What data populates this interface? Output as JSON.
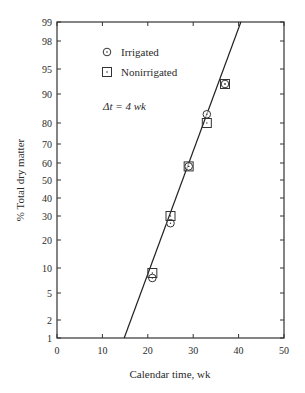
{
  "chart_data": {
    "type": "scatter",
    "title": "",
    "xlabel": "Calendar time, wk",
    "ylabel": "% Total dry matter",
    "xlim": [
      0,
      50
    ],
    "ylim": [
      1,
      99
    ],
    "yscale": "probability",
    "x_ticks": [
      0,
      10,
      20,
      30,
      40,
      50
    ],
    "y_ticks": [
      1,
      2,
      5,
      10,
      20,
      30,
      40,
      50,
      60,
      70,
      80,
      90,
      95,
      98,
      99
    ],
    "grid": false,
    "legend_position": "upper-left",
    "annotation": "Δt = 4 wk",
    "series": [
      {
        "name": "Irrigated",
        "marker": "circle",
        "points": [
          {
            "x": 21,
            "y": 8
          },
          {
            "x": 25,
            "y": 27
          },
          {
            "x": 29,
            "y": 58
          },
          {
            "x": 33,
            "y": 83
          },
          {
            "x": 37,
            "y": 92
          }
        ]
      },
      {
        "name": "Nonirrigated",
        "marker": "square",
        "points": [
          {
            "x": 21,
            "y": 9
          },
          {
            "x": 25,
            "y": 30
          },
          {
            "x": 29,
            "y": 58
          },
          {
            "x": 33,
            "y": 80
          },
          {
            "x": 37,
            "y": 92
          }
        ]
      }
    ],
    "fit_line": {
      "x_start": 14.8,
      "y_start": 1,
      "x_end": 40.5,
      "y_end": 99
    }
  },
  "labels": {
    "xlabel": "Calendar time, wk",
    "ylabel": "% Total dry matter",
    "legend_irrigated": "Irrigated",
    "legend_nonirrigated": "Nonirrigated",
    "annotation": "Δt = 4 wk"
  }
}
